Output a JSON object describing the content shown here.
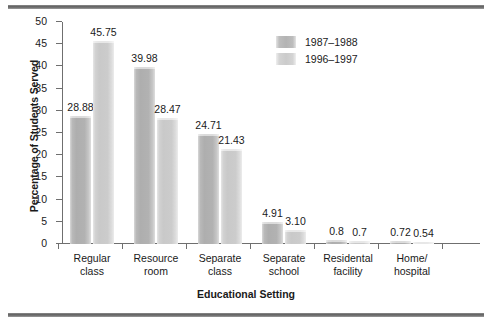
{
  "chart_data": {
    "type": "bar",
    "title": "",
    "xlabel": "Educational Setting",
    "ylabel": "Percentage of Students Served",
    "ylim": [
      0,
      50
    ],
    "yticks": [
      0,
      5,
      10,
      15,
      20,
      25,
      30,
      35,
      40,
      45,
      50
    ],
    "ytick_labels": [
      "0",
      "5",
      "10",
      "15",
      "20",
      "25",
      "30",
      "35",
      "40",
      "45",
      "50"
    ],
    "grid": false,
    "legend_position": "top-right",
    "categories": [
      "Regular\nclass",
      "Resource\nroom",
      "Separate\nclass",
      "Separate\nschool",
      "Residental\nfacility",
      "Home/\nhospital"
    ],
    "series": [
      {
        "name": "1987–1988",
        "color": "#b3b3b3",
        "values": [
          28.88,
          39.98,
          24.71,
          4.91,
          0.8,
          0.72
        ],
        "labels": [
          "28.88",
          "39.98",
          "24.71",
          "4.91",
          "0.8",
          "0.72"
        ]
      },
      {
        "name": "1996–1997",
        "color": "#cccccc",
        "values": [
          45.75,
          28.47,
          21.43,
          3.1,
          0.7,
          0.54
        ],
        "labels": [
          "45.75",
          "28.47",
          "21.43",
          "3.10",
          "0.7",
          "0.54"
        ]
      }
    ]
  },
  "legend": {
    "items": [
      {
        "label": "1987–1988"
      },
      {
        "label": "1996–1997"
      }
    ]
  },
  "axes": {
    "y_title": "Percentage of Students Served",
    "x_title": "Educational Setting"
  }
}
